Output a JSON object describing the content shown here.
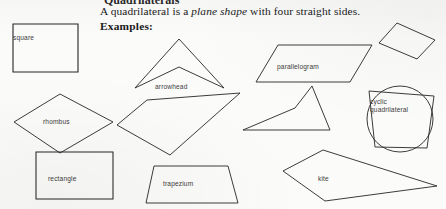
{
  "page": {
    "width": 446,
    "height": 209,
    "background_color": "#fbfbfa",
    "ink_color": "#222222",
    "cropped_heading_fragment": "Quadrilaterals"
  },
  "body_text": {
    "sentence_part_1": "A quadrilateral is a ",
    "sentence_italic": "plane shape",
    "sentence_part_2": " with four straight sides.",
    "full_sentence": "A quadrilateral is a plane shape with four straight sides.",
    "examples_heading": "Examples:"
  },
  "figure": {
    "caption": "Examples of quadrilaterals",
    "shape_count": 10,
    "labeled_count": 8,
    "shapes": [
      {
        "id": "square",
        "label": "square",
        "label_visible": true,
        "kind": "square",
        "convex": true,
        "points": "13,24 78,24 78,72 13,72"
      },
      {
        "id": "rhombus",
        "label": "rhombus",
        "label_visible": true,
        "kind": "rhombus",
        "convex": true,
        "points": "60,94 113,122 60,153 14,122"
      },
      {
        "id": "rectangle",
        "label": "rectangle",
        "label_visible": true,
        "kind": "rectangle",
        "convex": true,
        "points": "36,152 113,152 113,199 36,199"
      },
      {
        "id": "arrowhead",
        "label": "arrowhead",
        "label_visible": true,
        "kind": "concave-dart",
        "convex": false,
        "points": "179,39 224,88 179,67 135,88"
      },
      {
        "id": "irregular-quadrilateral",
        "label": "",
        "label_visible": false,
        "kind": "irregular",
        "convex": true,
        "points": "147,100 240,93 170,155 117,125"
      },
      {
        "id": "trapezium",
        "label": "trapezium",
        "label_visible": true,
        "kind": "trapezium",
        "convex": true,
        "points": "154,166 228,166 238,203 146,203"
      },
      {
        "id": "parallelogram",
        "label": "parallelogram",
        "label_visible": true,
        "kind": "parallelogram",
        "convex": true,
        "points": "278,45 372,45 350,82 256,82"
      },
      {
        "id": "concave-dart-2",
        "label": "",
        "label_visible": false,
        "kind": "concave-dart",
        "convex": false,
        "points": "312,86 330,130 243,130 295,108"
      },
      {
        "id": "kite",
        "label": "kite",
        "label_visible": true,
        "kind": "kite",
        "convex": true,
        "points": "323,150 437,186 325,201 283,171"
      },
      {
        "id": "tilted-rectangle",
        "label": "",
        "label_visible": false,
        "kind": "rectangle",
        "convex": true,
        "points": "397,23 435,40 417,59 379,43"
      },
      {
        "id": "cyclic-quadrilateral",
        "label_line_1": "cyclic",
        "label_line_2": "quadrilateral",
        "label": "cyclic quadrilateral",
        "label_visible": true,
        "kind": "cyclic",
        "convex": true,
        "points": "369,91 434,96 427,148 375,147",
        "circumcircle": {
          "cx": 400,
          "cy": 119,
          "r": 33
        }
      }
    ]
  }
}
